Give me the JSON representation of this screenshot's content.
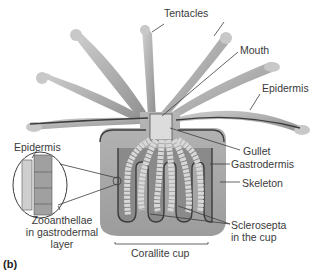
{
  "figure": {
    "panel_label": "(b)",
    "colors": {
      "tissue": "#9a9a9a",
      "tissue_light": "#c4c4c4",
      "skeleton": "#a8a8a8",
      "outline": "#3c3c3c",
      "zooxanthellae": "#d8d8d8",
      "background": "#ffffff"
    }
  },
  "labels": {
    "tentacles": "Tentacles",
    "mouth": "Mouth",
    "epidermis_right": "Epidermis",
    "gullet": "Gullet",
    "gastrodermis": "Gastrodermis",
    "skeleton": "Skeleton",
    "sclerosepta_line1": "Sclerosepta",
    "sclerosepta_line2": "in the cup",
    "corallite_cup": "Corallite cup",
    "epidermis_left": "Epidermis",
    "zooanthellae_line1": "Zooanthellae",
    "zooanthellae_line2": "in gastrodermal",
    "zooanthellae_line3": "layer"
  }
}
